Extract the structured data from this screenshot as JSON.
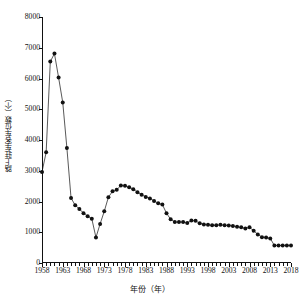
{
  "chart_data": {
    "type": "line",
    "title": "",
    "xlabel": "年份（年）",
    "ylabel": "路上驻车客车位数（个）",
    "xlim": [
      1958,
      2018
    ],
    "ylim": [
      0,
      8000
    ],
    "grid": false,
    "legend": null,
    "marker": "filled-circle",
    "y_ticks": [
      8000,
      7000,
      6000,
      5000,
      4000,
      3000,
      2000,
      1000,
      0
    ],
    "x_ticks": [
      1958,
      1963,
      1968,
      1973,
      1978,
      1983,
      1988,
      1993,
      1998,
      2003,
      2008,
      2013,
      2018
    ],
    "x_minor_tick_interval": 1,
    "series": [
      {
        "name": "路上驻车客车位数",
        "x": [
          1958,
          1959,
          1960,
          1961,
          1962,
          1963,
          1964,
          1965,
          1966,
          1967,
          1968,
          1969,
          1970,
          1971,
          1972,
          1973,
          1974,
          1975,
          1976,
          1977,
          1978,
          1979,
          1980,
          1981,
          1982,
          1983,
          1984,
          1985,
          1986,
          1987,
          1988,
          1989,
          1990,
          1991,
          1992,
          1993,
          1994,
          1995,
          1996,
          1997,
          1998,
          1999,
          2000,
          2001,
          2002,
          2003,
          2004,
          2005,
          2006,
          2007,
          2008,
          2009,
          2010,
          2011,
          2012,
          2013,
          2014,
          2015,
          2016,
          2017,
          2018
        ],
        "values": [
          2960,
          3600,
          6550,
          6810,
          6030,
          5220,
          3740,
          2110,
          1880,
          1760,
          1620,
          1520,
          1440,
          830,
          1270,
          1680,
          2140,
          2330,
          2380,
          2520,
          2510,
          2460,
          2400,
          2300,
          2220,
          2150,
          2100,
          2020,
          1940,
          1900,
          1620,
          1420,
          1330,
          1330,
          1330,
          1300,
          1380,
          1370,
          1290,
          1250,
          1240,
          1230,
          1230,
          1240,
          1230,
          1220,
          1200,
          1180,
          1160,
          1120,
          1160,
          1050,
          930,
          840,
          830,
          800,
          570,
          570,
          570,
          570,
          570
        ]
      }
    ]
  },
  "axis": {
    "ytick_labels": [
      "8000",
      "7000",
      "6000",
      "5000",
      "4000",
      "3000",
      "2000",
      "1000",
      "0"
    ],
    "xtick_labels": [
      "1958",
      "1963",
      "1968",
      "1973",
      "1978",
      "1983",
      "1988",
      "1993",
      "1998",
      "2003",
      "2008",
      "2013",
      "2018"
    ]
  },
  "colors": {
    "line": "#111111",
    "marker": "#111111",
    "axis": "#111111",
    "background": "#ffffff"
  }
}
